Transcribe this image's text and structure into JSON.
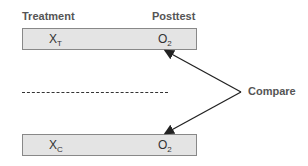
{
  "headers": {
    "treatment": "Treatment",
    "posttest": "Posttest"
  },
  "groups": [
    {
      "name": "treatment-group",
      "x": "X",
      "x_sub": "T",
      "o": "O",
      "o_sub": "2"
    },
    {
      "name": "control-group",
      "x": "X",
      "x_sub": "C",
      "o": "O",
      "o_sub": "2"
    }
  ],
  "compare_label": "Compare"
}
